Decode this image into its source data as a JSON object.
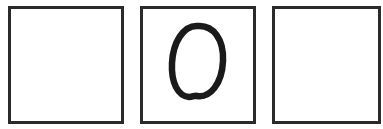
{
  "grid": {
    "cells": [
      {
        "index": 0,
        "content": ""
      },
      {
        "index": 1,
        "content": "O"
      },
      {
        "index": 2,
        "content": ""
      }
    ]
  },
  "colors": {
    "stroke": "#2b2b2b",
    "ink": "#1a1a1a",
    "background": "#ffffff"
  }
}
